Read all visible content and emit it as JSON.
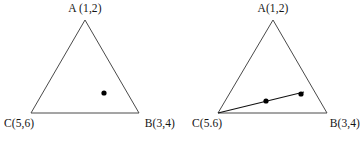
{
  "figure": {
    "canvas": {
      "width": 360,
      "height": 142,
      "background": "#ffffff"
    },
    "stroke_color": "#4a4a4a",
    "line_color": "#111111",
    "dot_color": "#000000",
    "panels": [
      {
        "id": "left",
        "name": "triangle-single-point",
        "labels": {
          "apex": "A (1,2)",
          "bottom_left": "C(5,6)",
          "bottom_right": "B(3,4)"
        },
        "vertices": {
          "apex": {
            "x": 85,
            "y": 20
          },
          "bottom_left": {
            "x": 31,
            "y": 113
          },
          "bottom_right": {
            "x": 139,
            "y": 113
          }
        },
        "points": [
          {
            "name": "interior-point",
            "x": 104,
            "y": 93,
            "r": 2.6
          }
        ],
        "segments": []
      },
      {
        "id": "right",
        "name": "triangle-with-segment",
        "labels": {
          "apex": "A(1,2)",
          "bottom_left": "C(5.6)",
          "bottom_right": "B(3,4)"
        },
        "vertices": {
          "apex": {
            "x": 93,
            "y": 20
          },
          "bottom_left": {
            "x": 38,
            "y": 113
          },
          "bottom_right": {
            "x": 147,
            "y": 113
          }
        },
        "points": [
          {
            "name": "segment-point-1",
            "x": 86,
            "y": 101,
            "r": 2.6
          },
          {
            "name": "segment-point-2",
            "x": 121,
            "y": 94,
            "r": 2.6
          }
        ],
        "segments": [
          {
            "name": "ray-from-c",
            "x1": 38,
            "y1": 113,
            "x2": 124,
            "y2": 92
          }
        ]
      }
    ]
  }
}
